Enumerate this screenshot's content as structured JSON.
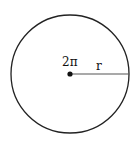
{
  "diagram": {
    "shape": "circle",
    "center_label": "2π",
    "radius_label": "r",
    "stroke_color": "#222222",
    "radius_line_color": "#555555"
  }
}
